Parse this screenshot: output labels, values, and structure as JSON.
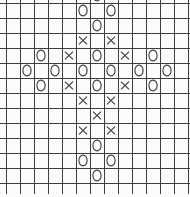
{
  "grid": {
    "columns": 13,
    "rows": 12,
    "cell_width": 14,
    "cell_height": 15,
    "origin_x": 6,
    "origin_y": 3,
    "vline_height": 194,
    "hline_width": 190,
    "line_color": "#3e3e3e",
    "symbol_color": "#3a3a3a",
    "background": "#fcfcfc",
    "symbol_legend": [
      "O",
      "X"
    ],
    "top_partial_symbol": {
      "col": 6,
      "symbol": "O"
    },
    "cells": [
      [
        "",
        "",
        "",
        "",
        "",
        "O",
        "",
        "O",
        "",
        "",
        "",
        "",
        ""
      ],
      [
        "",
        "",
        "",
        "",
        "",
        "",
        "O",
        "",
        "",
        "",
        "",
        "",
        ""
      ],
      [
        "",
        "",
        "",
        "",
        "",
        "X",
        "",
        "X",
        "",
        "",
        "",
        "",
        ""
      ],
      [
        "",
        "",
        "O",
        "",
        "X",
        "",
        "O",
        "",
        "X",
        "",
        "O",
        "",
        ""
      ],
      [
        "",
        "O",
        "",
        "O",
        "",
        "O",
        "",
        "O",
        "",
        "O",
        "",
        "O",
        ""
      ],
      [
        "",
        "",
        "O",
        "",
        "X",
        "",
        "O",
        "",
        "X",
        "",
        "O",
        "",
        ""
      ],
      [
        "",
        "",
        "",
        "",
        "",
        "X",
        "",
        "X",
        "",
        "",
        "",
        "",
        ""
      ],
      [
        "",
        "",
        "",
        "",
        "",
        "",
        "X",
        "",
        "",
        "",
        "",
        "",
        ""
      ],
      [
        "",
        "",
        "",
        "",
        "",
        "X",
        "",
        "X",
        "",
        "",
        "",
        "",
        ""
      ],
      [
        "",
        "",
        "",
        "",
        "",
        "",
        "O",
        "",
        "",
        "",
        "",
        "",
        ""
      ],
      [
        "",
        "",
        "",
        "",
        "",
        "O",
        "",
        "O",
        "",
        "",
        "",
        "",
        ""
      ],
      [
        "",
        "",
        "",
        "",
        "",
        "",
        "O",
        "",
        "",
        "",
        "",
        "",
        ""
      ]
    ]
  }
}
